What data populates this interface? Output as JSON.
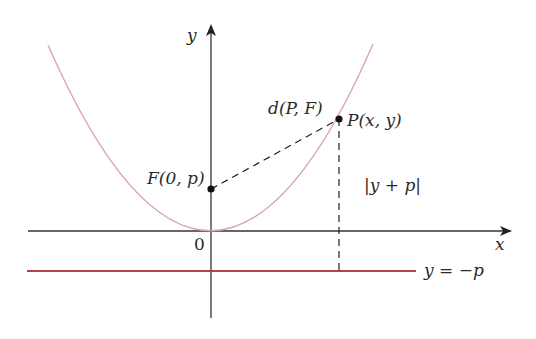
{
  "diagram": {
    "type": "parabola-focus-directrix",
    "colors": {
      "axes": "#333333",
      "parabola": "#d9a5b5",
      "directrix": "#b5404f",
      "dashed": "#222222",
      "points": "#111111",
      "text": "#2a2a2a"
    },
    "axes": {
      "x_label": "x",
      "y_label": "y",
      "origin_label": "0"
    },
    "points": {
      "focus": {
        "label": "F(0, p)"
      },
      "point_on_curve": {
        "label": "P(x, y)"
      }
    },
    "segments": {
      "distance_to_focus": {
        "label": "d(P, F)"
      },
      "distance_to_directrix": {
        "label": "|y + p|"
      }
    },
    "directrix": {
      "label": "y = −p"
    }
  }
}
